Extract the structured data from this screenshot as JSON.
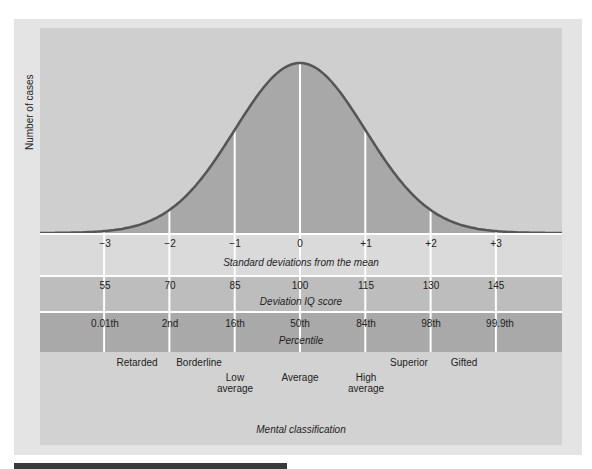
{
  "chart_data": {
    "type": "area",
    "title": "",
    "xlabel": "Standard deviations from the mean",
    "ylabel": "Number of cases",
    "distribution": "normal",
    "x": [
      -3,
      -2,
      -1,
      0,
      1,
      2,
      3
    ],
    "sd_labels": [
      "−3",
      "−2",
      "−1",
      "0",
      "+1",
      "+2",
      "+3"
    ],
    "iq_scores": [
      "55",
      "70",
      "85",
      "100",
      "115",
      "130",
      "145"
    ],
    "iq_label": "Deviation IQ score",
    "percentiles": [
      "0.01th",
      "2nd",
      "16th",
      "50th",
      "84th",
      "98th",
      "99.9th"
    ],
    "percentile_label": "Percentile",
    "classifications": [
      {
        "label": "Retarded",
        "lines": [
          "Retarded"
        ]
      },
      {
        "label": "Borderline",
        "lines": [
          "Borderline"
        ]
      },
      {
        "label": "Low average",
        "lines": [
          "Low",
          "average"
        ]
      },
      {
        "label": "Average",
        "lines": [
          "Average"
        ]
      },
      {
        "label": "High average",
        "lines": [
          "High",
          "average"
        ]
      },
      {
        "label": "Superior",
        "lines": [
          "Superior"
        ]
      },
      {
        "label": "Gifted",
        "lines": [
          "Gifted"
        ]
      }
    ],
    "classification_label": "Mental classification",
    "grid": true,
    "colors": {
      "background": "#cfcfcf",
      "area_fill": "#a8a8a8",
      "curve": "#555555",
      "gridlines": "#ffffff"
    }
  },
  "labels": {
    "ylabel": "Number of cases",
    "sd_caption": "Standard deviations from the mean",
    "iq_caption": "Deviation IQ score",
    "pct_caption": "Percentile",
    "class_caption": "Mental classification",
    "sd": [
      "−3",
      "−2",
      "−1",
      "0",
      "+1",
      "+2",
      "+3"
    ],
    "iq": [
      "55",
      "70",
      "85",
      "100",
      "115",
      "130",
      "145"
    ],
    "pct": [
      "0.01th",
      "2nd",
      "16th",
      "50th",
      "84th",
      "98th",
      "99.9th"
    ],
    "cls": {
      "retarded": "Retarded",
      "borderline": "Borderline",
      "low1": "Low",
      "low2": "average",
      "average": "Average",
      "high1": "High",
      "high2": "average",
      "superior": "Superior",
      "gifted": "Gifted"
    }
  }
}
